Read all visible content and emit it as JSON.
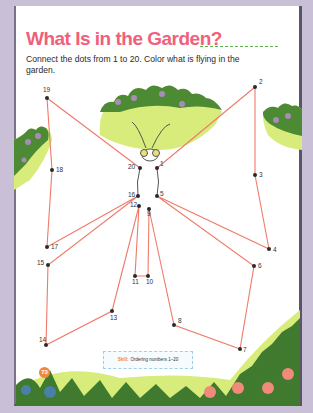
{
  "page": {
    "title": "What Is in the Garden?",
    "instructions": "Connect the dots from 1 to 20. Color what is flying in the garden.",
    "skill_label": "Skill:",
    "skill_text": "Ordering numbers 1–20",
    "page_number": "73"
  },
  "colors": {
    "title": "#f0607a",
    "line": "#f07a6a",
    "dot": "#2a2a2a",
    "bush_dark": "#3f7a2e",
    "bush_light": "#d7ec7a",
    "flower": "#f08a7a",
    "frame_bg": "#c9bfd6"
  },
  "dots": [
    {
      "n": "1",
      "x": 157,
      "y": 168
    },
    {
      "n": "2",
      "x": 255,
      "y": 87
    },
    {
      "n": "3",
      "x": 255,
      "y": 175
    },
    {
      "n": "4",
      "x": 269,
      "y": 249
    },
    {
      "n": "5",
      "x": 157,
      "y": 196
    },
    {
      "n": "6",
      "x": 254,
      "y": 266
    },
    {
      "n": "7",
      "x": 240,
      "y": 349
    },
    {
      "n": "8",
      "x": 174,
      "y": 325
    },
    {
      "n": "9",
      "x": 149,
      "y": 209
    },
    {
      "n": "10",
      "x": 148,
      "y": 276
    },
    {
      "n": "11",
      "x": 135,
      "y": 276
    },
    {
      "n": "12",
      "x": 139,
      "y": 206
    },
    {
      "n": "13",
      "x": 112,
      "y": 311
    },
    {
      "n": "14",
      "x": 46,
      "y": 345
    },
    {
      "n": "15",
      "x": 48,
      "y": 265
    },
    {
      "n": "16",
      "x": 138,
      "y": 196
    },
    {
      "n": "17",
      "x": 47,
      "y": 247
    },
    {
      "n": "18",
      "x": 52,
      "y": 170
    },
    {
      "n": "19",
      "x": 47,
      "y": 98
    },
    {
      "n": "20",
      "x": 140,
      "y": 168
    }
  ]
}
